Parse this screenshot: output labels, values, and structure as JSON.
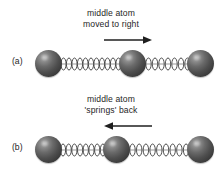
{
  "figure": {
    "title_implicit": "",
    "background_color": "#ffffff",
    "atom_color": "#4e4e4e",
    "spring_color": "#3d3d3d",
    "text_color": "#262626",
    "width": 222,
    "height": 172
  },
  "panels": [
    {
      "id": "a",
      "label": "(a)",
      "caption_line1": "middle atom",
      "caption_line2": "moved to right",
      "arrow": {
        "direction": "right",
        "icon": "arrow-right-icon",
        "x": 104,
        "y": 38,
        "length": 48
      },
      "atoms": [
        {
          "name": "left-atom",
          "cx": 49,
          "cy": 67
        },
        {
          "name": "middle-atom",
          "cx": 133,
          "cy": 67
        },
        {
          "name": "right-atom",
          "cx": 201,
          "cy": 67
        }
      ],
      "springs": [
        {
          "name": "left-spring",
          "state": "stretched",
          "x1": 60,
          "x2": 122,
          "coils": 11
        },
        {
          "name": "right-spring",
          "state": "compressed",
          "x1": 145,
          "x2": 191,
          "coils": 7
        }
      ]
    },
    {
      "id": "b",
      "label": "(b)",
      "caption_line1": "middle atom",
      "caption_line2": "'springs' back",
      "arrow": {
        "direction": "left",
        "icon": "arrow-left-icon",
        "x": 104,
        "y": 38,
        "length": 48
      },
      "atoms": [
        {
          "name": "left-atom",
          "cx": 49,
          "cy": 67
        },
        {
          "name": "middle-atom",
          "cx": 117,
          "cy": 67
        },
        {
          "name": "right-atom",
          "cx": 201,
          "cy": 67
        }
      ],
      "springs": [
        {
          "name": "left-spring",
          "state": "relaxed",
          "x1": 60,
          "x2": 106,
          "coils": 8
        },
        {
          "name": "right-spring",
          "state": "relaxed",
          "x1": 129,
          "x2": 191,
          "coils": 9
        }
      ]
    }
  ]
}
